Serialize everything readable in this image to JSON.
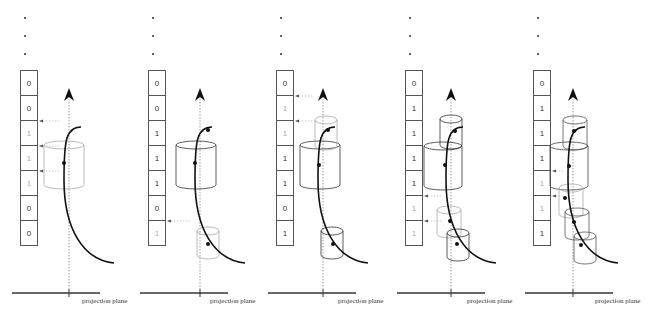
{
  "figure": {
    "type": "sequence-of-diagrams",
    "plane_label": "projection plane",
    "panels": [
      {
        "id": 1,
        "cells": [
          "0",
          "0",
          "1",
          "1",
          "1",
          "0",
          "0"
        ],
        "faint_cells": [
          2,
          3,
          4
        ],
        "x": 0
      },
      {
        "id": 2,
        "cells": [
          "0",
          "0",
          "1",
          "1",
          "1",
          "0",
          "1"
        ],
        "faint_cells": [
          6
        ],
        "x": 128
      },
      {
        "id": 3,
        "cells": [
          "0",
          "1",
          "1",
          "1",
          "1",
          "0",
          "1"
        ],
        "faint_cells": [
          1,
          2
        ],
        "x": 256
      },
      {
        "id": 4,
        "cells": [
          "0",
          "1",
          "1",
          "1",
          "1",
          "1",
          "1"
        ],
        "faint_cells": [
          5,
          6
        ],
        "x": 385
      },
      {
        "id": 5,
        "cells": [
          "0",
          "1",
          "1",
          "1",
          "1",
          "1",
          "1"
        ],
        "faint_cells": [
          4,
          5
        ],
        "x": 513
      }
    ]
  }
}
